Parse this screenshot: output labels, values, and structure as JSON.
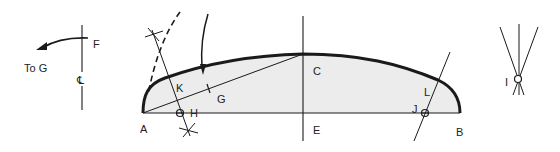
{
  "diagram": {
    "type": "geometric-construction",
    "colors": {
      "stroke": "#1a1a1a",
      "fill": "#ececec",
      "background": "#ffffff"
    },
    "left_detail": {
      "point_label": "F",
      "arrow_label": "To G",
      "centerline_symbol": "℄"
    },
    "main_figure": {
      "labels": {
        "A": "A",
        "B": "B",
        "C": "C",
        "E": "E",
        "G": "G",
        "H": "H",
        "J": "J",
        "K": "K",
        "L": "L"
      }
    },
    "right_detail": {
      "point_label": "I"
    }
  }
}
